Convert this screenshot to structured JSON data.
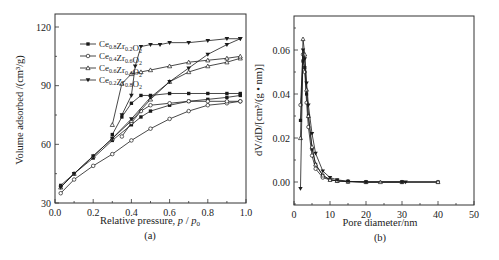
{
  "chart_data": [
    {
      "panel": "(a)",
      "type": "line",
      "title": "",
      "xlabel": "Relative pressure, p / p0",
      "ylabel": "Volume adsorbed /(cm³/g)",
      "xlim": [
        0.0,
        1.0
      ],
      "ylim": [
        30,
        120
      ],
      "xticks": [
        "0.0",
        "0.2",
        "0.4",
        "0.6",
        "0.8",
        "1.0"
      ],
      "yticks": [
        "30",
        "60",
        "90",
        "120"
      ],
      "grid": false,
      "legend_position": "upper left",
      "series": [
        {
          "name": "Ce0.8Zr0.2O2",
          "marker": "filled-square",
          "adsorption": {
            "x": [
              0.03,
              0.1,
              0.2,
              0.3,
              0.4,
              0.45,
              0.5,
              0.6,
              0.7,
              0.8,
              0.9,
              0.97
            ],
            "y": [
              39,
              45,
              53,
              62,
              70,
              74,
              77,
              80,
              82,
              83,
              84,
              85
            ]
          },
          "desorption": {
            "x": [
              0.97,
              0.9,
              0.8,
              0.7,
              0.6,
              0.5,
              0.45,
              0.4,
              0.35,
              0.3
            ],
            "y": [
              86,
              86,
              86,
              86,
              86,
              85,
              85,
              81,
              74,
              65
            ]
          }
        },
        {
          "name": "Ce0.4Zr0.6O2",
          "marker": "open-circle",
          "adsorption": {
            "x": [
              0.03,
              0.1,
              0.2,
              0.3,
              0.4,
              0.5,
              0.6,
              0.7,
              0.8,
              0.9,
              0.97
            ],
            "y": [
              35,
              42,
              49,
              55,
              62,
              68,
              73,
              77,
              80,
              81,
              82
            ]
          },
          "desorption": {
            "x": [
              0.97,
              0.9,
              0.8,
              0.7,
              0.6,
              0.5,
              0.45,
              0.4,
              0.35
            ],
            "y": [
              82,
              82,
              82,
              82,
              81,
              80,
              77,
              71,
              64
            ]
          }
        },
        {
          "name": "Ce0.6Zr0.4O2",
          "marker": "open-triangle",
          "adsorption": {
            "x": [
              0.03,
              0.1,
              0.2,
              0.3,
              0.4,
              0.5,
              0.6,
              0.7,
              0.8,
              0.9,
              0.97
            ],
            "y": [
              38,
              45,
              54,
              63,
              72,
              83,
              92,
              97,
              100,
              102,
              104
            ]
          },
          "desorption": {
            "x": [
              0.97,
              0.9,
              0.8,
              0.7,
              0.6,
              0.5,
              0.45,
              0.4,
              0.35,
              0.3
            ],
            "y": [
              105,
              104,
              103,
              102,
              100,
              98,
              97,
              96,
              91,
              70
            ]
          }
        },
        {
          "name": "Ce0.2Zr0.8O2",
          "marker": "filled-down-triangle",
          "adsorption": {
            "x": [
              0.03,
              0.1,
              0.2,
              0.3,
              0.4,
              0.5,
              0.6,
              0.7,
              0.8,
              0.9,
              0.97
            ],
            "y": [
              38,
              45,
              54,
              63,
              73,
              84,
              92,
              99,
              106,
              111,
              114
            ]
          },
          "desorption": {
            "x": [
              0.97,
              0.9,
              0.8,
              0.7,
              0.6,
              0.55,
              0.5,
              0.45,
              0.42,
              0.4,
              0.35
            ],
            "y": [
              114,
              114,
              113,
              112,
              112,
              111,
              111,
              110,
              100,
              85,
              75
            ]
          }
        }
      ]
    },
    {
      "panel": "(b)",
      "type": "line",
      "title": "",
      "xlabel": "Pore diameter/nm",
      "ylabel": "dV/dD/[cm³/(g·nm)]",
      "xlim": [
        0,
        50
      ],
      "ylim": [
        -0.01,
        0.07
      ],
      "xticks": [
        "0",
        "10",
        "20",
        "30",
        "40",
        "50"
      ],
      "yticks": [
        "0.00",
        "0.02",
        "0.04",
        "0.06"
      ],
      "grid": false,
      "series": [
        {
          "name": "Ce0.8Zr0.2O2",
          "marker": "filled-square",
          "x": [
            1.8,
            2.5,
            3.0,
            3.5,
            4.0,
            5.0,
            6.0,
            8.0,
            10,
            12,
            15,
            20,
            30,
            40
          ],
          "y": [
            0.028,
            0.055,
            0.052,
            0.04,
            0.03,
            0.015,
            0.008,
            0.003,
            0.001,
            0.0005,
            0.0002,
            0.0,
            0.0,
            0.0
          ]
        },
        {
          "name": "Ce0.4Zr0.6O2",
          "marker": "open-circle",
          "x": [
            1.8,
            2.5,
            3.0,
            3.5,
            4.0,
            5.0,
            6.0,
            8.0,
            10,
            12,
            15,
            20,
            30,
            40
          ],
          "y": [
            0.035,
            0.058,
            0.05,
            0.036,
            0.025,
            0.012,
            0.006,
            0.002,
            0.001,
            0.0005,
            0.0002,
            0.0,
            0.0,
            0.0
          ]
        },
        {
          "name": "Ce0.6Zr0.4O2",
          "marker": "open-triangle",
          "x": [
            1.8,
            2.5,
            3.0,
            3.5,
            4.0,
            5.0,
            6.0,
            8.0,
            10,
            12,
            15,
            20,
            24,
            30,
            40
          ],
          "y": [
            0.02,
            0.065,
            0.058,
            0.042,
            0.03,
            0.016,
            0.008,
            0.003,
            0.001,
            0.0005,
            0.0002,
            0.0,
            0.0,
            0.0,
            0.0
          ]
        },
        {
          "name": "Ce0.2Zr0.8O2",
          "marker": "filled-down-triangle",
          "x": [
            1.8,
            2.5,
            3.0,
            3.5,
            4.0,
            5.0,
            6.0,
            8.0,
            10,
            12,
            15,
            20,
            30,
            31
          ],
          "y": [
            -0.003,
            0.06,
            0.056,
            0.045,
            0.035,
            0.022,
            0.013,
            0.005,
            0.002,
            0.001,
            0.0003,
            0.0,
            0.0,
            0.0
          ]
        }
      ]
    }
  ],
  "figure": {
    "panel_a": {
      "caption": "(a)",
      "xlabel_prefix": "Relative pressure, ",
      "xlabel_var": "p",
      "xlabel_sep": " / ",
      "xlabel_var2": "p",
      "xlabel_sub": "0",
      "ylabel": "Volume adsorbed /(cm³/g)",
      "xticks": [
        "0.0",
        "0.2",
        "0.4",
        "0.6",
        "0.8",
        "1.0"
      ],
      "yticks": [
        "30",
        "60",
        "90",
        "120"
      ],
      "legend": [
        {
          "base1": "Ce",
          "sub1": "0.8",
          "base2": "Zr",
          "sub2": "0.2",
          "base3": "O",
          "sub3": "2"
        },
        {
          "base1": "Ce",
          "sub1": "0.4",
          "base2": "Zr",
          "sub2": "0.6",
          "base3": "O",
          "sub3": "2"
        },
        {
          "base1": "Ce",
          "sub1": "0.6",
          "base2": "Zr",
          "sub2": "0.4",
          "base3": "O",
          "sub3": "2"
        },
        {
          "base1": "Ce",
          "sub1": "0.2",
          "base2": "Zr",
          "sub2": "0.8",
          "base3": "O",
          "sub3": "2"
        }
      ]
    },
    "panel_b": {
      "caption": "(b)",
      "xlabel": "Pore diameter/nm",
      "ylabel": "dV/dD/[cm³/(g • nm)]",
      "xticks": [
        "0",
        "10",
        "20",
        "30",
        "40",
        "50"
      ],
      "yticks": [
        "0.00",
        "0.02",
        "0.04",
        "0.06"
      ]
    },
    "colors": {
      "ink": "#1a1a1a",
      "background": "#ffffff"
    }
  }
}
